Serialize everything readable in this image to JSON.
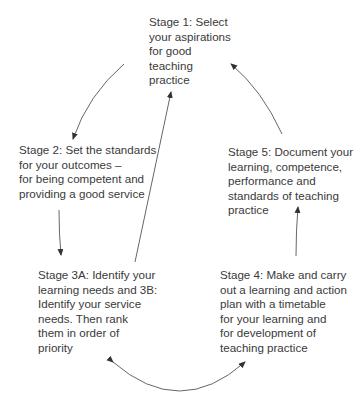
{
  "diagram": {
    "type": "cycle",
    "stages": [
      {
        "id": "stage1",
        "lines": [
          "Stage 1: Select",
          "your aspirations",
          "for good",
          "teaching",
          "practice"
        ]
      },
      {
        "id": "stage2",
        "lines": [
          "Stage 2: Set the standards",
          "for your outcomes –",
          "for being competent and",
          "providing a good service"
        ]
      },
      {
        "id": "stage3",
        "lines": [
          "Stage 3A: Identify your",
          "learning needs and 3B:",
          "Identify your service",
          "needs. Then rank",
          "them in order of",
          "priority"
        ]
      },
      {
        "id": "stage4",
        "lines": [
          "Stage 4: Make and carry",
          "out a learning and action",
          "plan with a timetable",
          "for your learning and",
          "for development of",
          "teaching practice"
        ]
      },
      {
        "id": "stage5",
        "lines": [
          "Stage 5: Document your",
          "learning, competence,",
          "performance and",
          "standards of teaching",
          "practice"
        ]
      }
    ],
    "edges": [
      {
        "from": "stage1",
        "to": "stage2"
      },
      {
        "from": "stage2",
        "to": "stage3"
      },
      {
        "from": "stage3",
        "to": "stage1"
      },
      {
        "from": "stage3",
        "to": "stage4",
        "bidirectional": true
      },
      {
        "from": "stage4",
        "to": "stage5"
      },
      {
        "from": "stage5",
        "to": "stage1"
      }
    ],
    "colors": {
      "text": "#3a3a3a",
      "arrow": "#555555"
    }
  }
}
